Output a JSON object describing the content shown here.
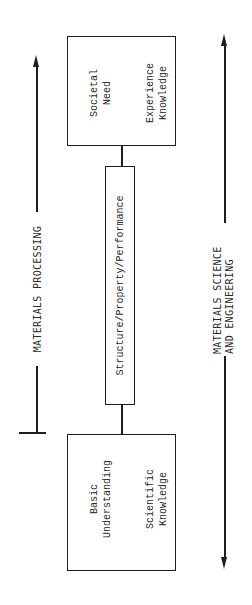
{
  "diagram": {
    "top_box": {
      "line1a": "Societal",
      "line1b": "Need",
      "line2a": "Experience",
      "line2b": "Knowledge"
    },
    "middle_box": {
      "label": "Structure/Property/Performance"
    },
    "bottom_box": {
      "line1a": "Basic",
      "line1b": "Understanding",
      "line2a": "Scientific",
      "line2b": "Knowledge"
    },
    "left_axis": {
      "label": "MATERIALS PROCESSING",
      "direction": "up"
    },
    "right_axis": {
      "line1": "MATERIALS SCIENCE",
      "line2": "AND ENGINEERING",
      "direction": "both"
    },
    "colors": {
      "ink": "#1e1e1e",
      "background": "#ffffff"
    }
  }
}
